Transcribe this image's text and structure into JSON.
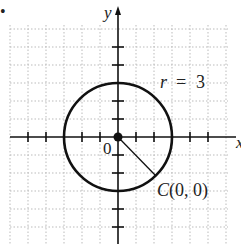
{
  "figure": {
    "bullet": "•",
    "axes": {
      "x_label": "x",
      "y_label": "y",
      "origin_label": "0"
    },
    "circle": {
      "center": [
        0,
        0
      ],
      "radius": 3,
      "radius_label_var": "r",
      "radius_label_eq": "=",
      "radius_label_val": "3",
      "center_label": "C(0, 0)"
    },
    "grid": {
      "x_range": [
        -6,
        6
      ],
      "y_range": [
        -6,
        6
      ],
      "style": "dotted"
    },
    "colors": {
      "stroke": "#111111",
      "grid": "#bbbbbb",
      "background": "#ffffff"
    }
  }
}
